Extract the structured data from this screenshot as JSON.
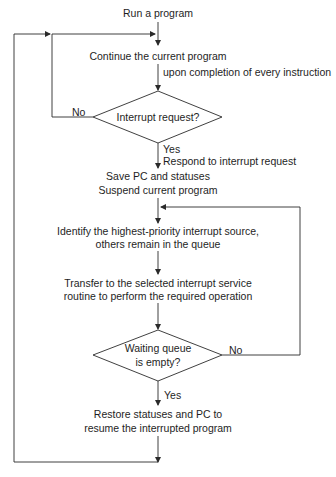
{
  "diagram": {
    "type": "flowchart",
    "colors": {
      "line": "#2a2a2a",
      "text": "#1e1e1e",
      "background": "#ffffff"
    },
    "nodes": {
      "start": {
        "text": "Run a program"
      },
      "continue": {
        "text": "Continue the current program"
      },
      "continue_note": {
        "text": "upon completion of every instruction"
      },
      "decision1": {
        "text": "Interrupt request?",
        "no": "No",
        "yes": "Yes"
      },
      "respond": {
        "text": "Respond to interrupt request"
      },
      "save": {
        "line1": "Save PC and statuses",
        "line2": "Suspend current program"
      },
      "identify": {
        "line1": "Identify the highest-priority interrupt source,",
        "line2": "others remain in the queue"
      },
      "transfer": {
        "line1": "Transfer to the selected interrupt service",
        "line2": "routine to perform the required operation"
      },
      "decision2": {
        "line1": "Waiting queue",
        "line2": "is empty?",
        "no": "No",
        "yes": "Yes"
      },
      "restore": {
        "line1": "Restore statuses and PC to",
        "line2": "resume the interrupted program"
      }
    },
    "edges": [
      {
        "from": "start",
        "to": "continue"
      },
      {
        "from": "continue",
        "to": "decision1",
        "label": "upon completion of every instruction"
      },
      {
        "from": "decision1",
        "to": "continue",
        "label": "No"
      },
      {
        "from": "decision1",
        "to": "save",
        "label": "Yes / Respond to interrupt request"
      },
      {
        "from": "save",
        "to": "identify"
      },
      {
        "from": "identify",
        "to": "transfer"
      },
      {
        "from": "transfer",
        "to": "decision2"
      },
      {
        "from": "decision2",
        "to": "identify",
        "label": "No"
      },
      {
        "from": "decision2",
        "to": "restore",
        "label": "Yes"
      },
      {
        "from": "restore",
        "to": "continue"
      }
    ]
  }
}
